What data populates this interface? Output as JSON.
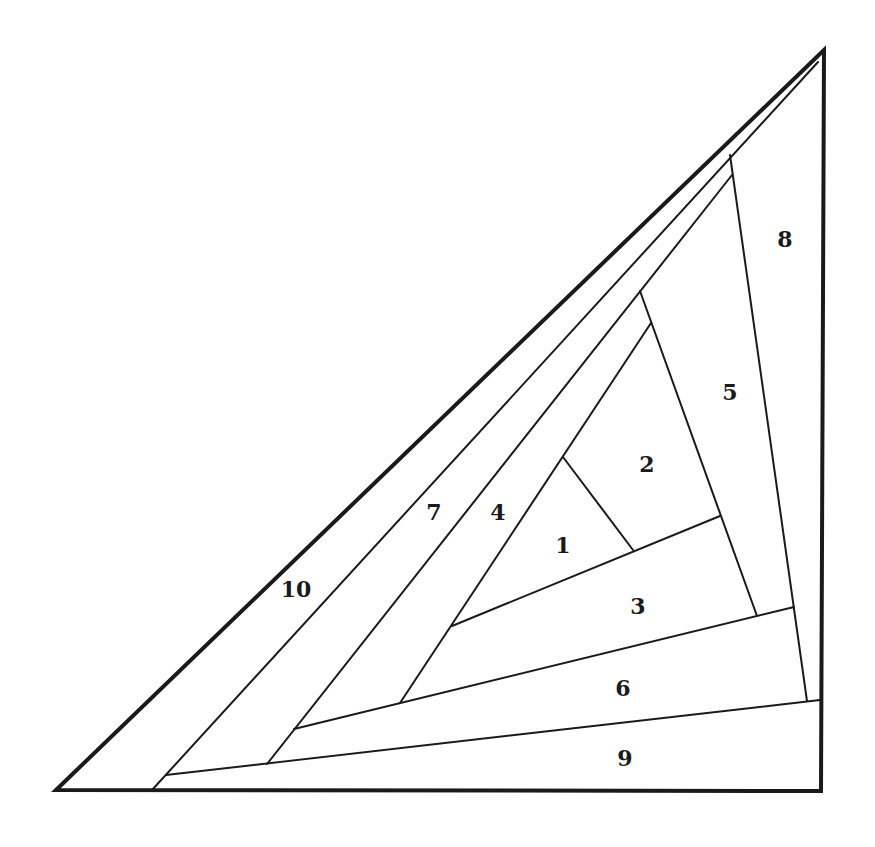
{
  "diagram": {
    "type": "paper-piecing-pattern",
    "colors": {
      "background": "#ffffff",
      "line": "#1a1a1a"
    },
    "outline": {
      "points": [
        [
          56,
          790
        ],
        [
          824,
          50
        ],
        [
          821,
          791
        ]
      ],
      "stroke_width": 4
    },
    "seams": [
      {
        "id": "seam-10-7",
        "from": [
          152,
          790
        ],
        "to": [
          818,
          62
        ],
        "width": 2
      },
      {
        "id": "seam-9-top",
        "from": [
          166,
          775
        ],
        "to": [
          820,
          700
        ],
        "width": 2
      },
      {
        "id": "seam-8",
        "from": [
          730,
          155
        ],
        "to": [
          807,
          701
        ],
        "width": 2
      },
      {
        "id": "seam-7-4",
        "from": [
          267,
          764
        ],
        "to": [
          732,
          175
        ],
        "width": 2
      },
      {
        "id": "seam-6-top",
        "from": [
          294,
          729
        ],
        "to": [
          794,
          607
        ],
        "width": 2
      },
      {
        "id": "seam-5",
        "from": [
          640,
          291
        ],
        "to": [
          757,
          616
        ],
        "width": 2
      },
      {
        "id": "seam-4-inner",
        "from": [
          400,
          703
        ],
        "to": [
          651,
          323
        ],
        "width": 2
      },
      {
        "id": "seam-3-top",
        "from": [
          452,
          626
        ],
        "to": [
          720,
          516
        ],
        "width": 2
      },
      {
        "id": "seam-1-2",
        "from": [
          563,
          457
        ],
        "to": [
          633,
          550
        ],
        "width": 2
      }
    ],
    "labels": [
      {
        "text": "1",
        "x": 563,
        "y": 553
      },
      {
        "text": "2",
        "x": 647,
        "y": 472
      },
      {
        "text": "3",
        "x": 638,
        "y": 614
      },
      {
        "text": "4",
        "x": 498,
        "y": 520
      },
      {
        "text": "5",
        "x": 730,
        "y": 400
      },
      {
        "text": "6",
        "x": 623,
        "y": 696
      },
      {
        "text": "7",
        "x": 434,
        "y": 520
      },
      {
        "text": "8",
        "x": 785,
        "y": 247
      },
      {
        "text": "9",
        "x": 625,
        "y": 766
      },
      {
        "text": "10",
        "x": 296,
        "y": 597
      }
    ]
  }
}
